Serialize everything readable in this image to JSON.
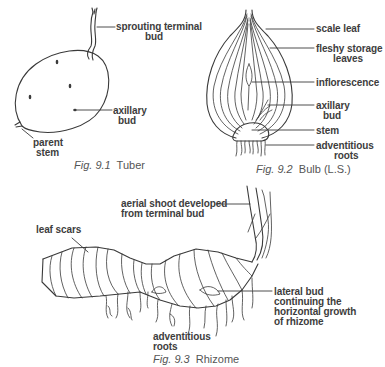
{
  "figures": [
    {
      "id": "fig-9-1",
      "caption_number": "Fig. 9.1",
      "caption_title": "Tuber",
      "labels": {
        "sprouting_terminal_bud": [
          "sprouting terminal",
          "bud"
        ],
        "axillary_bud": [
          "axillary",
          "bud"
        ],
        "parent_stem": [
          "parent",
          "stem"
        ]
      }
    },
    {
      "id": "fig-9-2",
      "caption_number": "Fig. 9.2",
      "caption_title": "Bulb (L.S.)",
      "labels": {
        "scale_leaf": [
          "scale leaf"
        ],
        "fleshy_storage_leaves": [
          "fleshy storage",
          "leaves"
        ],
        "inflorescence": [
          "inflorescence"
        ],
        "axillary_bud": [
          "axillary",
          "bud"
        ],
        "stem": [
          "stem"
        ],
        "adventitious_roots": [
          "adventitious",
          "roots"
        ]
      }
    },
    {
      "id": "fig-9-3",
      "caption_number": "Fig. 9.3",
      "caption_title": "Rhizome",
      "labels": {
        "aerial_shoot": [
          "aerial shoot developed",
          "from terminal bud"
        ],
        "leaf_scars": [
          "leaf scars"
        ],
        "lateral_bud": [
          "lateral bud",
          "continuing the",
          "horizontal growth",
          "of rhizome"
        ],
        "adventitious_roots": [
          "adventitious",
          "roots"
        ]
      }
    }
  ]
}
